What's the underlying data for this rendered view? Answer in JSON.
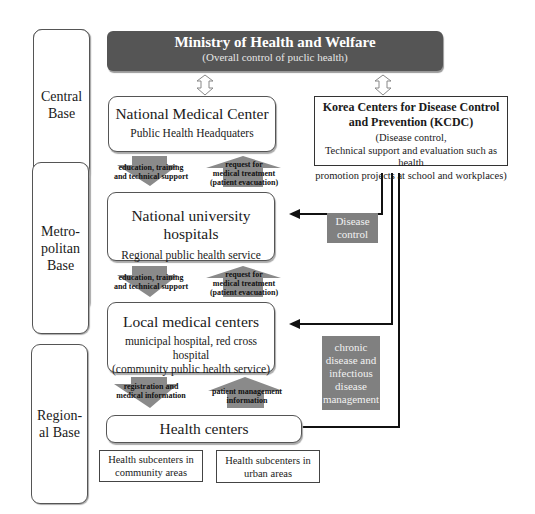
{
  "levels": [
    {
      "label": "Central\nBase",
      "lines": [
        "Central",
        "Base"
      ]
    },
    {
      "label": "Metro-\npolitan\nBase",
      "lines": [
        "Metro-",
        "politan",
        "Base"
      ]
    },
    {
      "label": "Region-\nal Base",
      "lines": [
        "Region-",
        "al Base"
      ]
    }
  ],
  "ministry": {
    "title": "Ministry of Health and Welfare",
    "subtitle": "(Overall control of puclic health)"
  },
  "nodes": {
    "nmc": {
      "title": "National Medical Center",
      "subtitle": "Public Health Headquaters"
    },
    "nuh": {
      "title": "National university hospitals",
      "subtitle": "Regional public health service"
    },
    "lmc": {
      "title": "Local medical centers",
      "subtitle_line1": "municipal hospital, red cross hospital",
      "subtitle_line2": "(community public health service)"
    },
    "hc": {
      "title": "Health centers"
    }
  },
  "kcdc": {
    "title_line1": "Korea Centers for Disease Control",
    "title_line2": "and Prevention (KCDC)",
    "desc_line1": "(Disease control,",
    "desc_line2": "Technical support and evaluation such as health",
    "desc_line3": "promotion projects at school and workplaces)"
  },
  "flows": {
    "down1": {
      "line1": "education, training",
      "line2": "and technical support"
    },
    "up1": {
      "line1": "request for",
      "line2": "medical treatment",
      "line3": "(patient evacuation)"
    },
    "down2": {
      "line1": "education, training",
      "line2": "and technical support"
    },
    "up2": {
      "line1": "request for",
      "line2": "medical treatment",
      "line3": "(patient evacuation)"
    },
    "down3": {
      "line1": "registration and",
      "line2": "medical information"
    },
    "up3": {
      "line1": "patient management",
      "line2": "information"
    }
  },
  "labels": {
    "disease_control": {
      "line1": "Disease",
      "line2": "control"
    },
    "chronic": {
      "line1": "chronic",
      "line2": "disease and",
      "line3": "infectious",
      "line4": "disease",
      "line5": "management"
    }
  },
  "subcenters": {
    "community": {
      "line1": "Health subcenters in",
      "line2": "community areas"
    },
    "urban": {
      "line1": "Health subcenters in",
      "line2": "urban areas"
    }
  },
  "colors": {
    "ministry_fill": "#555555",
    "arrow_fill": "#8a8a8a",
    "gray_box": "#808080",
    "border": "#555555"
  }
}
